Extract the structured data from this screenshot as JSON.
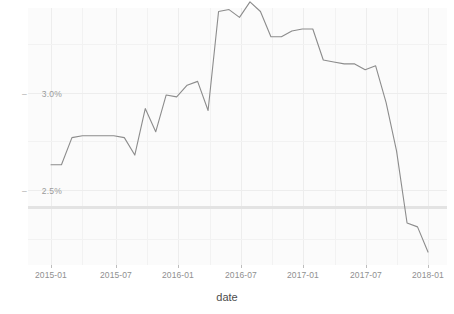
{
  "chart_data": {
    "type": "line",
    "title": "",
    "xlabel": "date",
    "ylabel": "",
    "grid": true,
    "legend": null,
    "x_tick_labels": [
      "2015-01",
      "2015-07",
      "2016-01",
      "2016-07",
      "2017-01",
      "2017-07",
      "2018-01"
    ],
    "y_tick_labels": [
      "3.0%",
      "2.5%"
    ],
    "y_tick_values": [
      3.0,
      2.5
    ],
    "ylim": [
      2.15,
      3.58
    ],
    "xlim": [
      "2014-11",
      "2018-02"
    ],
    "y_unit": "%",
    "reference_line": {
      "value": 2.41,
      "color": "#e3e3e3",
      "orientation": "horizontal"
    },
    "series": [
      {
        "name": "rate",
        "color": "#8c8c8c",
        "x": [
          "2015-01",
          "2015-02",
          "2015-03",
          "2015-04",
          "2015-05",
          "2015-06",
          "2015-07",
          "2015-08",
          "2015-09",
          "2015-10",
          "2015-11",
          "2015-12",
          "2016-01",
          "2016-02",
          "2016-03",
          "2016-04",
          "2016-05",
          "2016-06",
          "2016-07",
          "2016-08",
          "2016-09",
          "2016-10",
          "2016-11",
          "2016-12",
          "2017-01",
          "2017-02",
          "2017-03",
          "2017-04",
          "2017-05",
          "2017-06",
          "2017-07",
          "2017-08",
          "2017-09",
          "2017-10",
          "2017-11",
          "2017-12",
          "2018-01"
        ],
        "values": [
          2.63,
          2.63,
          2.77,
          2.78,
          2.78,
          2.78,
          2.78,
          2.77,
          2.68,
          2.92,
          2.8,
          2.99,
          2.98,
          3.04,
          3.06,
          2.91,
          3.42,
          3.43,
          3.39,
          3.47,
          3.42,
          3.29,
          3.29,
          3.32,
          3.33,
          3.33,
          3.17,
          3.16,
          3.15,
          3.15,
          3.12,
          3.14,
          2.95,
          2.7,
          2.33,
          2.31,
          2.18
        ]
      }
    ]
  },
  "axis": {
    "y_dash": "–",
    "x_title": "date"
  }
}
